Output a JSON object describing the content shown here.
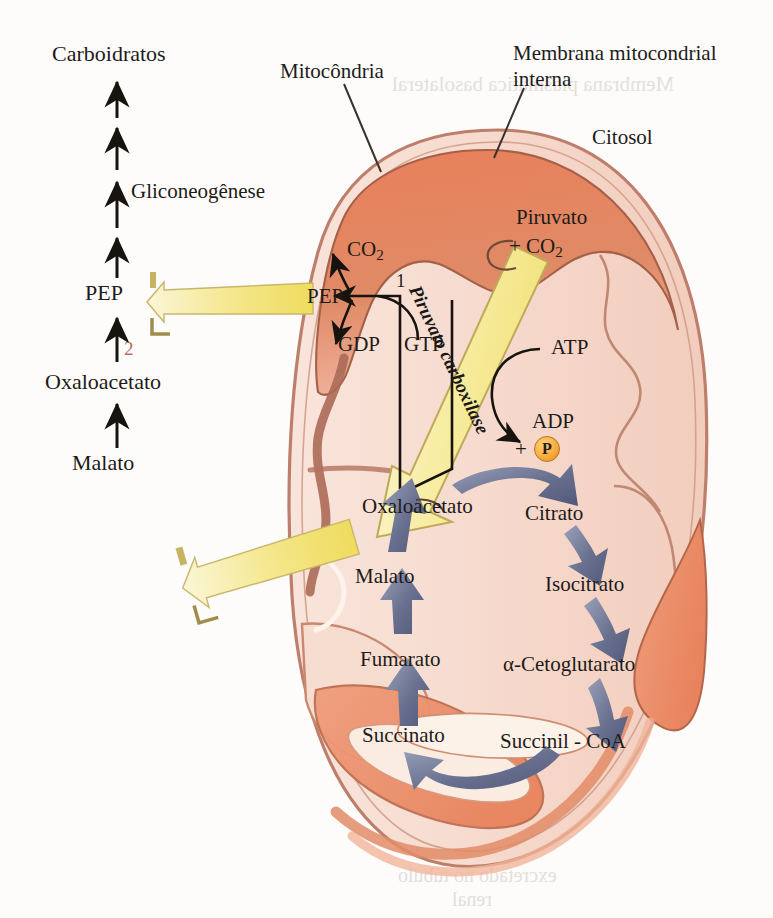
{
  "figure": {
    "language": "pt-BR"
  },
  "annotations": {
    "mitochondria": "Mitocôndria",
    "inner_membrane_line1": "Membrana mitocondrial",
    "inner_membrane_line2": "interna",
    "cytosol": "Citosol"
  },
  "cytosol_pathway": {
    "top_label": "Carboidratos",
    "pathway_label": "Gliconeogênese",
    "steps": [
      {
        "label": "PEP"
      },
      {
        "label": "Oxaloacetato"
      },
      {
        "label": "Malato"
      }
    ],
    "step_number": "2"
  },
  "matrix": {
    "pep": "PEP",
    "co2": "CO",
    "co2_sub": "2",
    "gdp": "GDP",
    "gtp": "GTP",
    "pepck_number": "1",
    "oxaloacetate": "Oxaloacetato",
    "malate": "Malato"
  },
  "pyruvate_branch": {
    "pyruvate": "Piruvato",
    "plus_co2": "+ CO",
    "plus_co2_sub": "2",
    "enzyme": "Piruvato carboxilase",
    "atp": "ATP",
    "adp": "ADP",
    "plus": "+",
    "phosphate": "P"
  },
  "citric_acid_cycle": {
    "intermediates": [
      {
        "id": "oxaloacetate",
        "label": "Oxaloacetato"
      },
      {
        "id": "citrate",
        "label": "Citrato"
      },
      {
        "id": "isocitrate",
        "label": "Isocitrato"
      },
      {
        "id": "alpha_kg",
        "label": "α-Cetoglutarato"
      },
      {
        "id": "succinyl_coa",
        "label": "Succinil - CoA"
      },
      {
        "id": "succinate",
        "label": "Succinato"
      },
      {
        "id": "fumarate",
        "label": "Fumarato"
      },
      {
        "id": "malate",
        "label": "Malato"
      }
    ]
  },
  "transporters": [
    {
      "id": "pep-shuttle",
      "cargo": "PEP",
      "direction": "matrix-to-cytosol"
    },
    {
      "id": "malate-shuttle",
      "cargo": "Malato",
      "direction": "matrix-to-cytosol"
    }
  ],
  "colors": {
    "mito_outer_membrane": "#b97a67",
    "mito_matrix_light": "#f4d2c4",
    "mito_crista_dark": "#dd7d5c",
    "cycle_arrow": "#6d7596",
    "transport_arrow": "#f3e27f",
    "enzyme_arrow": "#f7f0b0",
    "phosphate_circle": "#f6a93a",
    "step_number_red": "#b4705e",
    "text": "#1d1b19"
  },
  "background_showthrough": {
    "top": "Membrana plasmática basolateral",
    "bottom_line1": "excretado no túbulo",
    "bottom_line2": "renal"
  }
}
